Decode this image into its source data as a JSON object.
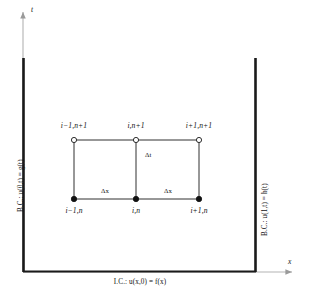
{
  "figure": {
    "background_color": "#ffffff",
    "line_color": "#111111",
    "domain_boundary_color": "#000000"
  },
  "axes": {
    "x_axis_label": "x",
    "y_axis_label": "t",
    "origin_x": 23,
    "origin_y": 272,
    "x_axis_end": 295,
    "y_axis_top": 8
  },
  "boundary_conditions": {
    "left": {
      "prefix": "B.C.:",
      "equation": "u(0,t) = g(t)",
      "full": "B.C.:  u(0,t) = g(t)"
    },
    "right": {
      "prefix": "B.C.:",
      "equation": "u(1,t) = h(t)",
      "full": "B.C.:  u(1,t) = h(t)"
    }
  },
  "initial_condition": {
    "prefix": "I.C.:",
    "equation": "u(x,0) = f(x)",
    "full": "I.C.:  u(x,0) = f(x)"
  },
  "stencil": {
    "upper_nodes": [
      {
        "label": "i−1,n+1",
        "marker": "open-circle",
        "x": 74,
        "y": 140
      },
      {
        "label": "i,n+1",
        "marker": "open-circle",
        "x": 136,
        "y": 140
      },
      {
        "label": "i+1,n+1",
        "marker": "open-circle",
        "x": 199,
        "y": 140
      }
    ],
    "lower_nodes": [
      {
        "label": "i−1,n",
        "marker": "filled-circle",
        "x": 74,
        "y": 199
      },
      {
        "label": "i,n",
        "marker": "filled-circle",
        "x": 136,
        "y": 199
      },
      {
        "label": "i+1,n",
        "marker": "filled-circle",
        "x": 199,
        "y": 199
      }
    ],
    "step_labels": {
      "time_step": "Δt",
      "space_step_left": "Δx",
      "space_step_right": "Δx"
    }
  },
  "domain_walls": {
    "left_wall_x": 23,
    "right_wall_x": 256,
    "wall_top_y": 58,
    "wall_bottom_y": 272
  }
}
